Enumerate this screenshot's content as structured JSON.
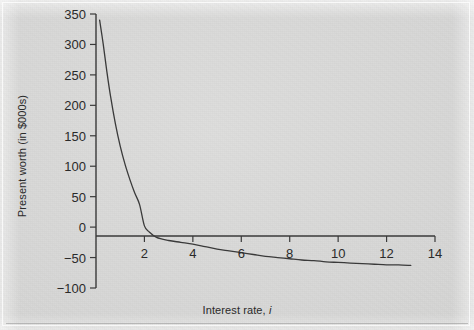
{
  "figure": {
    "background_color": "#d8d8d8",
    "ink_color": "#3a3a3a"
  },
  "chart_data": {
    "type": "line",
    "title": "",
    "xlabel_prefix": "Interest rate, ",
    "xlabel_symbol": "i",
    "xlabel": "Interest rate, i",
    "ylabel": "Present worth (in $000s)",
    "xlim": [
      0,
      14
    ],
    "ylim": [
      -100,
      350
    ],
    "xticks": [
      2,
      4,
      6,
      8,
      10,
      12,
      14
    ],
    "yticks": [
      -100,
      -50,
      0,
      50,
      100,
      150,
      200,
      250,
      300,
      350
    ],
    "xtick_labels": [
      "2",
      "4",
      "6",
      "8",
      "10",
      "12",
      "14"
    ],
    "ytick_labels": [
      "−100",
      "−50",
      "0",
      "50",
      "100",
      "150",
      "200",
      "250",
      "300",
      "350"
    ],
    "grid": false,
    "legend": null,
    "series": [
      {
        "name": "Present worth",
        "color": "#3a3a3a",
        "line_width": 1.3,
        "x": [
          0.15,
          0.3,
          0.45,
          0.6,
          0.8,
          1.0,
          1.2,
          1.4,
          1.6,
          1.8,
          2.0,
          2.2,
          2.5,
          3.0,
          3.5,
          4.0,
          4.5,
          5.0,
          5.5,
          6.0,
          6.5,
          7.0,
          7.5,
          8.0,
          8.5,
          9.0,
          9.5,
          10.0,
          10.5,
          11.0,
          11.5,
          12.0,
          12.5,
          13.0
        ],
        "y": [
          340,
          300,
          255,
          215,
          170,
          133,
          103,
          78,
          56,
          37,
          2,
          -8,
          -17,
          -22,
          -25,
          -28,
          -32,
          -36,
          -39,
          -42,
          -45,
          -48,
          -50,
          -52,
          -54,
          -55,
          -57,
          -58,
          -59,
          -60,
          -61,
          -62,
          -62,
          -63
        ]
      }
    ]
  }
}
